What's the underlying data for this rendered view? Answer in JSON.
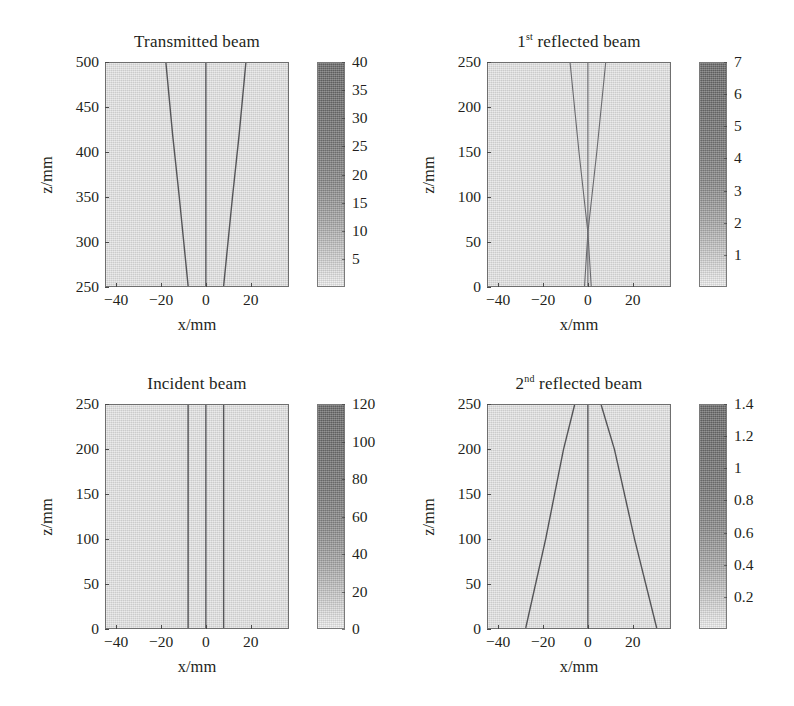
{
  "figure": {
    "background_color": "#ffffff",
    "plot_face_color": "#d9d9d9",
    "axis_color": "#6f6f6f",
    "ray_color": "#555558",
    "width": 794,
    "height": 706
  },
  "chart_data": [
    {
      "type": "heatmap",
      "id": "transmitted-beam",
      "title": "Transmitted beam",
      "title_prefix": "",
      "title_superscript": "",
      "xlabel": "x/mm",
      "ylabel": "z/mm",
      "xlim": [
        -45,
        37
      ],
      "ylim": [
        250,
        500
      ],
      "xticks": [
        -40,
        -20,
        0,
        20
      ],
      "xticklabels": [
        "−40",
        "−20",
        "0",
        "20"
      ],
      "yticks": [
        250,
        300,
        350,
        400,
        450,
        500
      ],
      "yticklabels": [
        "250",
        "300",
        "350",
        "400",
        "450",
        "500"
      ],
      "grid": false,
      "colorbar": {
        "min": 0,
        "max": 40,
        "ticks": [
          5,
          10,
          15,
          20,
          25,
          30,
          35,
          40
        ],
        "ticklabels": [
          "5",
          "10",
          "15",
          "20",
          "25",
          "30",
          "35",
          "40"
        ],
        "orientation": "vertical",
        "position": "right"
      },
      "features": "Three dark ray traces: a vertical central ray at x=0 and two symmetric rays diverging outward with increasing z (from about x=±8 mm at z=250 mm to about x=±18 mm at z=500 mm).",
      "rays": [
        {
          "name": "central-ray",
          "points": [
            [
              0,
              250
            ],
            [
              0,
              500
            ]
          ]
        },
        {
          "name": "left-diverging-ray",
          "points": [
            [
              -8,
              250
            ],
            [
              -12,
              350
            ],
            [
              -15,
              420
            ],
            [
              -18,
              500
            ]
          ]
        },
        {
          "name": "right-diverging-ray",
          "points": [
            [
              8,
              250
            ],
            [
              12,
              350
            ],
            [
              15,
              420
            ],
            [
              18,
              500
            ]
          ]
        }
      ]
    },
    {
      "type": "heatmap",
      "id": "first-reflected-beam",
      "title": "1st reflected beam",
      "title_prefix": "1",
      "title_superscript": "st",
      "title_rest": " reflected beam",
      "xlabel": "x/mm",
      "ylabel": "z/mm",
      "xlim": [
        -45,
        37
      ],
      "ylim": [
        0,
        250
      ],
      "xticks": [
        -40,
        -20,
        0,
        20
      ],
      "xticklabels": [
        "−40",
        "−20",
        "0",
        "20"
      ],
      "yticks": [
        0,
        50,
        100,
        150,
        200,
        250
      ],
      "yticklabels": [
        "0",
        "50",
        "100",
        "150",
        "200",
        "250"
      ],
      "grid": false,
      "colorbar": {
        "min": 0,
        "max": 7,
        "ticks": [
          1,
          2,
          3,
          4,
          5,
          6,
          7
        ],
        "ticklabels": [
          "1",
          "2",
          "3",
          "4",
          "5",
          "6",
          "7"
        ],
        "orientation": "vertical",
        "position": "right"
      },
      "features": "Faint rays converging to a narrow waist near z≈60 mm at x=0, then diverging upward to about x=±8 mm at z=250 mm; a faint central vertical ray at x=0.",
      "rays": [
        {
          "name": "central-ray",
          "points": [
            [
              0,
              0
            ],
            [
              0,
              250
            ]
          ]
        },
        {
          "name": "left-ray",
          "points": [
            [
              -1.5,
              0
            ],
            [
              0,
              60
            ],
            [
              -4,
              150
            ],
            [
              -8,
              250
            ]
          ]
        },
        {
          "name": "right-ray",
          "points": [
            [
              1.5,
              0
            ],
            [
              0,
              60
            ],
            [
              4,
              150
            ],
            [
              8,
              250
            ]
          ]
        }
      ]
    },
    {
      "type": "heatmap",
      "id": "incident-beam",
      "title": "Incident beam",
      "title_prefix": "",
      "title_superscript": "",
      "xlabel": "x/mm",
      "ylabel": "z/mm",
      "xlim": [
        -45,
        37
      ],
      "ylim": [
        0,
        250
      ],
      "xticks": [
        -40,
        -20,
        0,
        20
      ],
      "xticklabels": [
        "−40",
        "−20",
        "0",
        "20"
      ],
      "yticks": [
        0,
        50,
        100,
        150,
        200,
        250
      ],
      "yticklabels": [
        "0",
        "50",
        "100",
        "150",
        "200",
        "250"
      ],
      "grid": false,
      "colorbar": {
        "min": 0,
        "max": 120,
        "ticks": [
          0,
          20,
          40,
          60,
          80,
          100,
          120
        ],
        "ticklabels": [
          "0",
          "20",
          "40",
          "60",
          "80",
          "100",
          "120"
        ],
        "orientation": "vertical",
        "position": "right"
      },
      "features": "Three straight vertical parallel rays at x ≈ −8, 0 and +8 mm spanning the full z range (collimated beam).",
      "rays": [
        {
          "name": "central-ray",
          "points": [
            [
              0,
              0
            ],
            [
              0,
              250
            ]
          ]
        },
        {
          "name": "left-ray",
          "points": [
            [
              -8,
              0
            ],
            [
              -8,
              250
            ]
          ]
        },
        {
          "name": "right-ray",
          "points": [
            [
              8,
              0
            ],
            [
              8,
              250
            ]
          ]
        }
      ]
    },
    {
      "type": "heatmap",
      "id": "second-reflected-beam",
      "title": "2nd reflected beam",
      "title_prefix": "2",
      "title_superscript": "nd",
      "title_rest": " reflected beam",
      "xlabel": "x/mm",
      "ylabel": "z/mm",
      "xlim": [
        -45,
        37
      ],
      "ylim": [
        0,
        250
      ],
      "xticks": [
        -40,
        -20,
        0,
        20
      ],
      "xticklabels": [
        "−40",
        "−20",
        "0",
        "20"
      ],
      "yticks": [
        0,
        50,
        100,
        150,
        200,
        250
      ],
      "yticklabels": [
        "0",
        "50",
        "100",
        "150",
        "200",
        "250"
      ],
      "grid": false,
      "colorbar": {
        "min": 0,
        "max": 1.4,
        "ticks": [
          0.2,
          0.4,
          0.6,
          0.8,
          1,
          1.2,
          1.4
        ],
        "ticklabels": [
          "0.2",
          "0.4",
          "0.6",
          "0.8",
          "1",
          "1.2",
          "1.4"
        ],
        "orientation": "vertical",
        "position": "right"
      },
      "features": "Strongly diverging rays: narrow near z=250 mm (x ≈ ±6 mm) and wide at z=0 (x ≈ −28 and +31 mm), plus a vertical central ray at x=0.",
      "rays": [
        {
          "name": "central-ray",
          "points": [
            [
              0,
              0
            ],
            [
              0,
              250
            ]
          ]
        },
        {
          "name": "left-diverging-ray",
          "points": [
            [
              -6,
              250
            ],
            [
              -11,
              200
            ],
            [
              -19,
              100
            ],
            [
              -28,
              0
            ]
          ]
        },
        {
          "name": "right-diverging-ray",
          "points": [
            [
              6,
              250
            ],
            [
              12,
              200
            ],
            [
              21,
              100
            ],
            [
              31,
              0
            ]
          ]
        }
      ]
    }
  ]
}
